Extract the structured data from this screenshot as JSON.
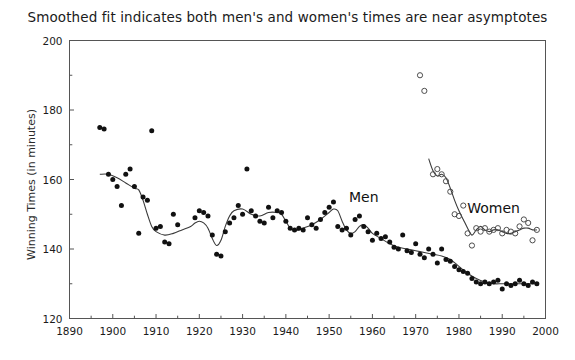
{
  "chart_data": {
    "type": "scatter",
    "title": "Smoothed fit indicates both men's and women's times are near asymptotes",
    "xlabel": "",
    "ylabel": "Winning Times (in minutes)",
    "xlim": [
      1890,
      2000
    ],
    "ylim": [
      120,
      200
    ],
    "xticks": [
      1890,
      1900,
      1910,
      1920,
      1930,
      1940,
      1950,
      1960,
      1970,
      1980,
      1990,
      2000
    ],
    "xtick_labels": [
      "1890",
      "1900",
      "1910",
      "1920",
      "1930",
      "1940",
      "1950",
      "1960",
      "1970",
      "1980",
      "1990",
      "2000"
    ],
    "xminor_step": 5,
    "yticks": [
      120,
      140,
      160,
      180,
      200
    ],
    "ytick_labels": [
      "120",
      "140",
      "160",
      "180",
      "200"
    ],
    "yminor_step": 10,
    "grid": false,
    "legend_position": "inline-annotation",
    "annotations": [
      {
        "text": "Men",
        "x": 1958,
        "y": 153.5
      },
      {
        "text": "Women",
        "x": 1988,
        "y": 150.5
      }
    ],
    "series": [
      {
        "name": "Men",
        "marker": "filled-circle",
        "color": "#111111",
        "points": [
          [
            1897,
            175.0
          ],
          [
            1898,
            174.5
          ],
          [
            1899,
            161.5
          ],
          [
            1900,
            160.0
          ],
          [
            1901,
            158.0
          ],
          [
            1902,
            152.5
          ],
          [
            1903,
            161.5
          ],
          [
            1904,
            163.0
          ],
          [
            1905,
            158.0
          ],
          [
            1906,
            144.5
          ],
          [
            1907,
            155.0
          ],
          [
            1908,
            154.0
          ],
          [
            1909,
            174.0
          ],
          [
            1910,
            146.0
          ],
          [
            1911,
            146.5
          ],
          [
            1912,
            142.0
          ],
          [
            1913,
            141.5
          ],
          [
            1914,
            150.0
          ],
          [
            1915,
            147.0
          ],
          [
            1919,
            149.0
          ],
          [
            1920,
            151.0
          ],
          [
            1921,
            150.5
          ],
          [
            1922,
            149.5
          ],
          [
            1923,
            144.0
          ],
          [
            1924,
            138.5
          ],
          [
            1925,
            138.0
          ],
          [
            1926,
            145.0
          ],
          [
            1927,
            147.5
          ],
          [
            1928,
            149.0
          ],
          [
            1929,
            152.5
          ],
          [
            1930,
            150.0
          ],
          [
            1931,
            163.0
          ],
          [
            1932,
            151.0
          ],
          [
            1933,
            149.5
          ],
          [
            1934,
            148.0
          ],
          [
            1935,
            147.5
          ],
          [
            1936,
            152.0
          ],
          [
            1937,
            149.0
          ],
          [
            1938,
            151.0
          ],
          [
            1939,
            150.5
          ],
          [
            1940,
            148.0
          ],
          [
            1941,
            146.0
          ],
          [
            1942,
            145.5
          ],
          [
            1943,
            146.0
          ],
          [
            1944,
            145.5
          ],
          [
            1945,
            149.0
          ],
          [
            1946,
            147.0
          ],
          [
            1947,
            146.0
          ],
          [
            1948,
            148.5
          ],
          [
            1949,
            150.5
          ],
          [
            1950,
            152.0
          ],
          [
            1951,
            153.5
          ],
          [
            1952,
            146.5
          ],
          [
            1953,
            145.5
          ],
          [
            1954,
            146.0
          ],
          [
            1955,
            144.0
          ],
          [
            1956,
            148.5
          ],
          [
            1957,
            149.5
          ],
          [
            1958,
            146.5
          ],
          [
            1959,
            145.0
          ],
          [
            1960,
            142.5
          ],
          [
            1961,
            144.5
          ],
          [
            1962,
            143.0
          ],
          [
            1963,
            143.5
          ],
          [
            1964,
            142.0
          ],
          [
            1965,
            140.5
          ],
          [
            1966,
            140.0
          ],
          [
            1967,
            144.0
          ],
          [
            1968,
            139.5
          ],
          [
            1969,
            139.0
          ],
          [
            1970,
            141.5
          ],
          [
            1971,
            138.5
          ],
          [
            1972,
            137.5
          ],
          [
            1973,
            140.0
          ],
          [
            1974,
            138.5
          ],
          [
            1975,
            136.0
          ],
          [
            1976,
            140.0
          ],
          [
            1977,
            137.0
          ],
          [
            1978,
            136.5
          ],
          [
            1979,
            135.0
          ],
          [
            1980,
            134.0
          ],
          [
            1981,
            133.5
          ],
          [
            1982,
            133.0
          ],
          [
            1983,
            131.5
          ],
          [
            1984,
            130.5
          ],
          [
            1985,
            130.0
          ],
          [
            1986,
            130.5
          ],
          [
            1987,
            130.0
          ],
          [
            1988,
            130.5
          ],
          [
            1989,
            131.0
          ],
          [
            1990,
            128.5
          ],
          [
            1991,
            130.0
          ],
          [
            1992,
            129.5
          ],
          [
            1993,
            130.0
          ],
          [
            1994,
            131.0
          ],
          [
            1995,
            130.0
          ],
          [
            1996,
            129.5
          ],
          [
            1997,
            130.5
          ],
          [
            1998,
            130.0
          ]
        ],
        "smooth_fit": [
          [
            1897,
            161.5
          ],
          [
            1899,
            161.5
          ],
          [
            1901,
            160.5
          ],
          [
            1903,
            159.0
          ],
          [
            1905,
            157.5
          ],
          [
            1906,
            157.0
          ],
          [
            1907,
            154.0
          ],
          [
            1908,
            150.0
          ],
          [
            1909,
            146.5
          ],
          [
            1910,
            145.0
          ],
          [
            1912,
            144.0
          ],
          [
            1914,
            144.5
          ],
          [
            1916,
            145.5
          ],
          [
            1918,
            146.5
          ],
          [
            1919,
            147.5
          ],
          [
            1920,
            148.0
          ],
          [
            1921,
            147.5
          ],
          [
            1922,
            146.0
          ],
          [
            1923,
            143.0
          ],
          [
            1924,
            141.0
          ],
          [
            1925,
            142.5
          ],
          [
            1926,
            146.5
          ],
          [
            1927,
            149.5
          ],
          [
            1928,
            151.0
          ],
          [
            1930,
            151.5
          ],
          [
            1932,
            150.0
          ],
          [
            1934,
            149.5
          ],
          [
            1936,
            150.5
          ],
          [
            1938,
            150.5
          ],
          [
            1939,
            150.0
          ],
          [
            1940,
            148.0
          ],
          [
            1941,
            146.0
          ],
          [
            1942,
            145.5
          ],
          [
            1943,
            145.5
          ],
          [
            1944,
            146.0
          ],
          [
            1946,
            147.0
          ],
          [
            1948,
            148.5
          ],
          [
            1950,
            150.5
          ],
          [
            1951,
            151.5
          ],
          [
            1952,
            151.0
          ],
          [
            1953,
            148.0
          ],
          [
            1954,
            145.5
          ],
          [
            1955,
            144.5
          ],
          [
            1956,
            145.0
          ],
          [
            1957,
            146.5
          ],
          [
            1958,
            147.0
          ],
          [
            1959,
            146.0
          ],
          [
            1960,
            144.5
          ],
          [
            1962,
            143.0
          ],
          [
            1964,
            141.5
          ],
          [
            1966,
            140.5
          ],
          [
            1968,
            140.0
          ],
          [
            1970,
            139.5
          ],
          [
            1972,
            139.0
          ],
          [
            1974,
            138.5
          ],
          [
            1976,
            138.0
          ],
          [
            1978,
            137.0
          ],
          [
            1980,
            135.0
          ],
          [
            1982,
            133.0
          ],
          [
            1984,
            131.5
          ],
          [
            1986,
            130.5
          ],
          [
            1988,
            130.0
          ],
          [
            1990,
            130.0
          ],
          [
            1992,
            130.0
          ],
          [
            1994,
            130.0
          ],
          [
            1996,
            130.0
          ],
          [
            1998,
            130.0
          ]
        ]
      },
      {
        "name": "Women",
        "marker": "open-circle",
        "color": "#4d4d4d",
        "points": [
          [
            1971,
            190.0
          ],
          [
            1972,
            185.5
          ],
          [
            1974,
            161.5
          ],
          [
            1975,
            163.0
          ],
          [
            1976,
            161.5
          ],
          [
            1977,
            159.5
          ],
          [
            1978,
            156.5
          ],
          [
            1979,
            150.0
          ],
          [
            1980,
            149.5
          ],
          [
            1981,
            152.5
          ],
          [
            1982,
            144.5
          ],
          [
            1983,
            141.0
          ],
          [
            1984,
            146.0
          ],
          [
            1985,
            145.0
          ],
          [
            1986,
            146.0
          ],
          [
            1987,
            145.0
          ],
          [
            1988,
            145.5
          ],
          [
            1989,
            146.0
          ],
          [
            1990,
            144.5
          ],
          [
            1991,
            145.5
          ],
          [
            1992,
            145.0
          ],
          [
            1993,
            144.5
          ],
          [
            1994,
            146.5
          ],
          [
            1995,
            148.5
          ],
          [
            1996,
            147.5
          ],
          [
            1997,
            142.5
          ],
          [
            1998,
            145.5
          ]
        ],
        "smooth_fit": [
          [
            1973,
            166.0
          ],
          [
            1974,
            162.5
          ],
          [
            1975,
            161.0
          ],
          [
            1976,
            161.5
          ],
          [
            1977,
            160.5
          ],
          [
            1978,
            157.5
          ],
          [
            1979,
            154.0
          ],
          [
            1980,
            151.0
          ],
          [
            1981,
            148.5
          ],
          [
            1982,
            146.0
          ],
          [
            1983,
            144.0
          ],
          [
            1984,
            145.5
          ],
          [
            1985,
            146.5
          ],
          [
            1986,
            145.5
          ],
          [
            1987,
            145.0
          ],
          [
            1988,
            145.5
          ],
          [
            1989,
            145.5
          ],
          [
            1990,
            145.0
          ],
          [
            1991,
            144.5
          ],
          [
            1992,
            144.5
          ],
          [
            1993,
            145.0
          ],
          [
            1994,
            145.5
          ],
          [
            1995,
            146.0
          ],
          [
            1996,
            146.0
          ],
          [
            1997,
            145.5
          ],
          [
            1998,
            145.5
          ]
        ]
      }
    ]
  }
}
